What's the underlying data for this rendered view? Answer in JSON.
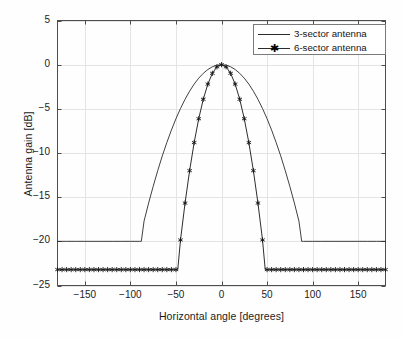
{
  "chart_data": {
    "type": "line",
    "title": "",
    "xlabel": "Horizontal angle [degrees]",
    "ylabel": "Antenna gain [dB]",
    "xlim": [
      -180,
      180
    ],
    "ylim": [
      -25,
      5
    ],
    "xticks": [
      -150,
      -100,
      -50,
      0,
      50,
      100,
      150
    ],
    "yticks": [
      5,
      0,
      -5,
      -10,
      -15,
      -20,
      -25
    ],
    "xtick_labels": [
      "−150",
      "−100",
      "−50",
      "0",
      "50",
      "100",
      "150"
    ],
    "ytick_labels": [
      "5",
      "0",
      "−5",
      "−10",
      "−15",
      "−20",
      "−25"
    ],
    "grid": true,
    "legend_position": "upper right",
    "series": [
      {
        "name": "3-sector antenna",
        "marker": "none",
        "line_style": "solid",
        "color": "#2b2b2b",
        "model": "3gpp-sector",
        "beamwidth_deg": 70,
        "front_to_back_db": 20,
        "floor_db": -20,
        "peak_db": 0,
        "floor_onset_deg": 88,
        "x": [
          -180,
          -170,
          -160,
          -150,
          -140,
          -130,
          -120,
          -110,
          -100,
          -95,
          -90,
          -88,
          -85,
          -80,
          -75,
          -70,
          -65,
          -60,
          -55,
          -50,
          -45,
          -40,
          -35,
          -30,
          -25,
          -20,
          -15,
          -10,
          -5,
          0,
          5,
          10,
          15,
          20,
          25,
          30,
          35,
          40,
          45,
          50,
          55,
          60,
          65,
          70,
          75,
          80,
          85,
          88,
          90,
          95,
          100,
          110,
          120,
          130,
          140,
          150,
          160,
          170,
          180
        ],
        "y": [
          -20,
          -20,
          -20,
          -20,
          -20,
          -20,
          -20,
          -20,
          -20,
          -20,
          -20,
          -20,
          -17.71,
          -15.67,
          -13.78,
          -12.0,
          -10.33,
          -8.82,
          -7.41,
          -6.12,
          -4.96,
          -3.92,
          -3.0,
          -2.2,
          -1.53,
          -0.98,
          -0.55,
          -0.24,
          -0.06,
          0,
          -0.06,
          -0.24,
          -0.55,
          -0.98,
          -1.53,
          -2.2,
          -3.0,
          -3.92,
          -4.96,
          -6.12,
          -7.41,
          -8.82,
          -10.33,
          -12.0,
          -13.78,
          -15.67,
          -17.71,
          -20,
          -20,
          -20,
          -20,
          -20,
          -20,
          -20,
          -20,
          -20,
          -20,
          -20,
          -20
        ]
      },
      {
        "name": "6-sector antenna",
        "marker": "star",
        "line_style": "solid",
        "color": "#151515",
        "model": "3gpp-sector",
        "beamwidth_deg": 35,
        "front_to_back_db": 23,
        "floor_db": -23.2,
        "peak_db": 0,
        "floor_onset_deg": 48,
        "marker_step_deg": 5,
        "x": [
          -180,
          -175,
          -170,
          -165,
          -160,
          -155,
          -150,
          -145,
          -140,
          -135,
          -130,
          -125,
          -120,
          -115,
          -110,
          -105,
          -100,
          -95,
          -90,
          -85,
          -80,
          -75,
          -70,
          -65,
          -60,
          -55,
          -50,
          -48,
          -45,
          -40,
          -35,
          -30,
          -25,
          -20,
          -15,
          -10,
          -5,
          0,
          5,
          10,
          15,
          20,
          25,
          30,
          35,
          40,
          45,
          48,
          50,
          55,
          60,
          65,
          70,
          75,
          80,
          85,
          90,
          95,
          100,
          105,
          110,
          115,
          120,
          125,
          130,
          135,
          140,
          145,
          150,
          155,
          160,
          165,
          170,
          175,
          180
        ],
        "y": [
          -23.2,
          -23.2,
          -23.2,
          -23.2,
          -23.2,
          -23.2,
          -23.2,
          -23.2,
          -23.2,
          -23.2,
          -23.2,
          -23.2,
          -23.2,
          -23.2,
          -23.2,
          -23.2,
          -23.2,
          -23.2,
          -23.2,
          -23.2,
          -23.2,
          -23.2,
          -23.2,
          -23.2,
          -23.2,
          -23.2,
          -23.2,
          -23.2,
          -19.84,
          -15.67,
          -12.0,
          -8.82,
          -6.12,
          -3.92,
          -2.2,
          -0.98,
          -0.24,
          0,
          -0.24,
          -0.98,
          -2.2,
          -3.92,
          -6.12,
          -8.82,
          -12.0,
          -15.67,
          -19.84,
          -23.2,
          -23.2,
          -23.2,
          -23.2,
          -23.2,
          -23.2,
          -23.2,
          -23.2,
          -23.2,
          -23.2,
          -23.2,
          -23.2,
          -23.2,
          -23.2,
          -23.2,
          -23.2,
          -23.2,
          -23.2,
          -23.2,
          -23.2,
          -23.2,
          -23.2,
          -23.2,
          -23.2,
          -23.2,
          -23.2,
          -23.2,
          -23.2
        ]
      }
    ]
  },
  "legend": {
    "items": [
      {
        "label": "3-sector antenna"
      },
      {
        "label": "6-sector antenna"
      }
    ]
  },
  "colors": {
    "axis": "#4d4d4d",
    "grid": "#e4e4e4",
    "series_a": "#2b2b2b",
    "series_b": "#151515",
    "background": "#fefefe"
  }
}
